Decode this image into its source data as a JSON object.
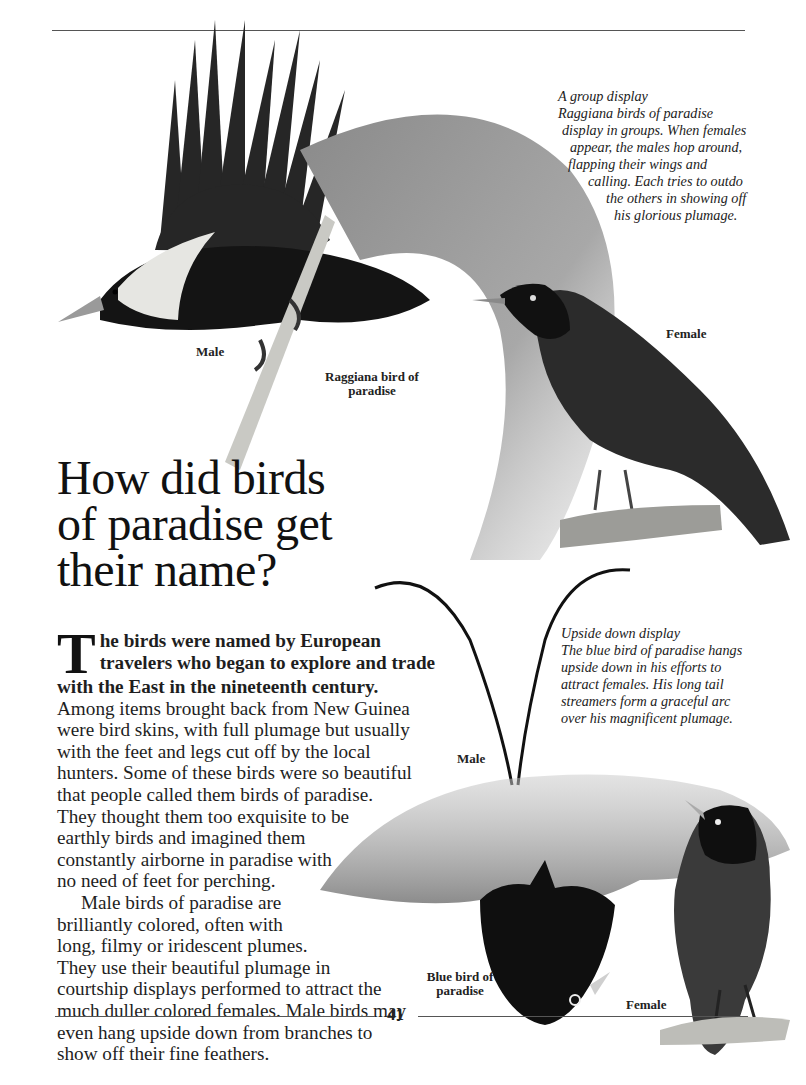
{
  "page": {
    "heading": [
      "How did birds",
      "of paradise get",
      "their name?"
    ],
    "page_number": "41"
  },
  "body": {
    "dropcap": "T",
    "lead_lines": [
      "he birds were named by European",
      "travelers who began to explore and trade",
      "with the East in the nineteenth century."
    ],
    "para1_lines": [
      "Among items brought back from New Guinea",
      "were bird skins, with full plumage but usually",
      "with the feet and legs cut off by the local",
      "hunters. Some of these birds were so beautiful",
      "that people called them birds of paradise.",
      "They thought them too exquisite to be",
      "earthly birds and imagined them",
      "constantly airborne in paradise with",
      "no need of feet for perching."
    ],
    "para2_lines": [
      "Male birds of paradise are",
      "brilliantly colored, often with",
      "long, filmy or iridescent plumes.",
      "They use their beautiful plumage in",
      "courtship displays performed to attract the",
      "much duller colored females. Male birds may",
      "even hang upside down from branches to",
      "show off their fine feathers."
    ]
  },
  "captions": {
    "group_display": {
      "title": "A group display",
      "lines": [
        "Raggiana birds of paradise",
        "display in groups. When females",
        "appear, the males hop around,",
        "flapping their wings and",
        "calling. Each tries to outdo",
        "the others in showing off",
        "his glorious plumage."
      ]
    },
    "upside_down_display": {
      "title": "Upside down display",
      "lines": [
        "The blue bird of paradise hangs",
        "upside down in his efforts to",
        "attract females. His long tail",
        "streamers form a graceful arc",
        "over his magnificent plumage."
      ]
    }
  },
  "labels": {
    "raggiana_male": "Male",
    "raggiana_species": [
      "Raggiana bird of",
      "paradise"
    ],
    "raggiana_female": "Female",
    "blue_male": "Male",
    "blue_species": [
      "Blue bird of",
      "paradise"
    ],
    "blue_female": "Female"
  },
  "colors": {
    "ink": "#1a1a1a",
    "rule": "#555555",
    "plumage_dark": "#141414",
    "plumage_mid": "#7a7a7a",
    "plumage_light": "#b9b9b9",
    "pale_collar": "#e6e6e2"
  }
}
